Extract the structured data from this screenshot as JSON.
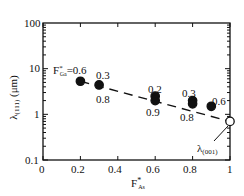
{
  "chart_data": {
    "type": "scatter",
    "title": "",
    "xlabel": "F*As",
    "ylabel": "λ(111) (μm)",
    "x_scale": "linear",
    "y_scale": "log",
    "xlim": [
      0,
      1
    ],
    "ylim": [
      0.1,
      100
    ],
    "x_ticks": [
      "0",
      "0.2",
      "0.4",
      "0.6",
      "0.8",
      "1"
    ],
    "y_ticks": [
      "0.1",
      "1",
      "10",
      "100"
    ],
    "grid": false,
    "legend": null,
    "series": [
      {
        "name": "λ(111) measured",
        "marker": "filled-circle",
        "points": [
          {
            "x": 0.2,
            "y": 5.3,
            "label": "F*Ga=0.6"
          },
          {
            "x": 0.3,
            "y": 4.4,
            "label_top": "0.3",
            "label_bottom": "0.8"
          },
          {
            "x": 0.6,
            "y": 2.5,
            "label": "0.2"
          },
          {
            "x": 0.6,
            "y": 2.0,
            "label": "0.9"
          },
          {
            "x": 0.8,
            "y": 2.0,
            "label": "0.3"
          },
          {
            "x": 0.8,
            "y": 1.7,
            "label": "0.8"
          },
          {
            "x": 0.9,
            "y": 1.5,
            "label": "0.6"
          }
        ]
      },
      {
        "name": "λ(001)",
        "marker": "open-circle",
        "points": [
          {
            "x": 1.0,
            "y": 0.7,
            "label": "λ(001)"
          }
        ]
      }
    ],
    "trend_line": {
      "style": "dashed",
      "from": {
        "x": 0.2,
        "y": 5.3
      },
      "to": {
        "x": 1.0,
        "y": 0.7
      }
    },
    "annotations": [
      "F*Ga=0.6",
      "0.3",
      "0.8",
      "0.2",
      "0.9",
      "0.3",
      "0.8",
      "0.6",
      "λ(001)"
    ]
  },
  "labels": {
    "ylabel_main": "λ",
    "ylabel_sub": "(111)",
    "ylabel_unit": " (μm)",
    "xlabel_main": "F",
    "xlabel_sup": "*",
    "xlabel_sub": "As",
    "fga_main": "F",
    "fga_sup": "*",
    "fga_sub": "Ga",
    "fga_value": "=0.6",
    "pt2_top": "0.3",
    "pt2_bottom": "0.8",
    "pt3_top": "0.2",
    "pt3_bottom": "0.9",
    "pt4_top": "0.3",
    "pt4_bottom": "0.8",
    "pt5_top": "0.6",
    "lambda001_main": "λ",
    "lambda001_sub": "(001)"
  },
  "axis": {
    "x_ticks": [
      "0",
      "0.2",
      "0.4",
      "0.6",
      "0.8",
      "1"
    ],
    "y_ticks": [
      "100",
      "10",
      "1",
      "0.1"
    ]
  }
}
